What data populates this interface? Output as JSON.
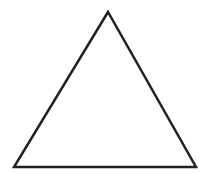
{
  "diagram": {
    "shape": "triangle",
    "type": "equilateral-outline",
    "stroke_color": "#222222",
    "fill_color": "#ffffff",
    "stroke_width": 2.5,
    "vertices": {
      "apex": [
        108,
        12
      ],
      "bottom_left": [
        14,
        167
      ],
      "bottom_right": [
        196,
        167
      ]
    }
  }
}
